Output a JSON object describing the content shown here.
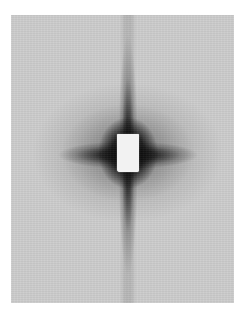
{
  "image": {
    "subject": "x-ray diffraction pattern",
    "colors": {
      "background": "#ffffff",
      "plate": "#cdcdcd",
      "dark_pattern": "#0a0a0a",
      "beamstop": "#f2f2f2"
    }
  }
}
